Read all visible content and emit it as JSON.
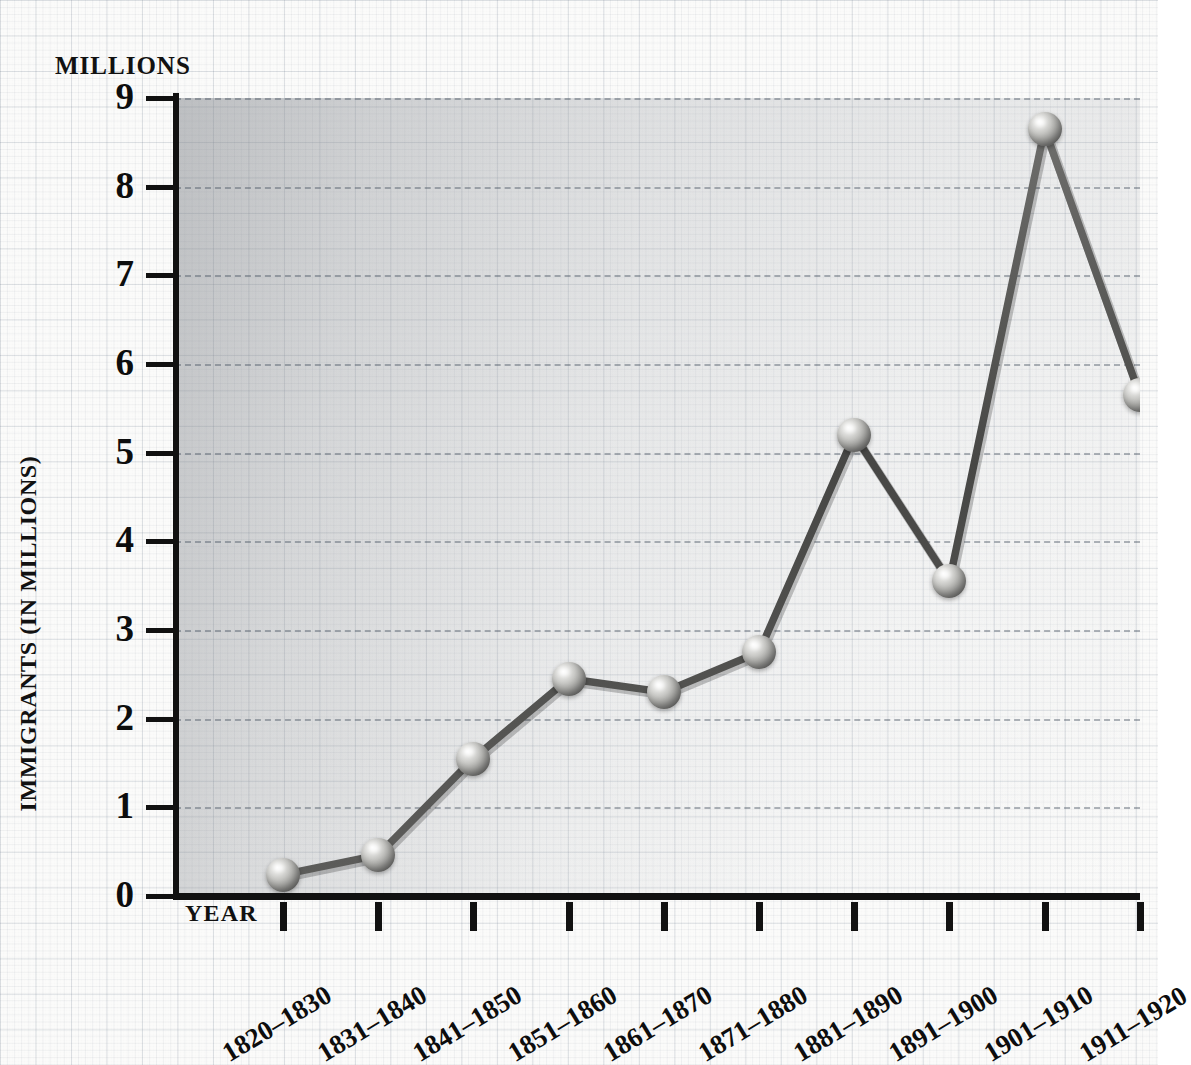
{
  "title": "IMMIGRATION TO THE UNITED STATES, 1820-1920",
  "axes": {
    "y_unit_label": "MILLIONS",
    "y_title": "IMMIGRANTS (IN MILLIONS)",
    "x_title": "YEAR",
    "y_ticks": [
      "9",
      "8",
      "7",
      "6",
      "5",
      "4",
      "3",
      "2",
      "1",
      "0"
    ]
  },
  "chart_data": {
    "type": "line",
    "title": "IMMIGRATION TO THE UNITED STATES, 1820-1920",
    "xlabel": "YEAR",
    "ylabel": "IMMIGRANTS (IN MILLIONS)",
    "ylim": [
      0,
      9
    ],
    "yticks": [
      0,
      1,
      2,
      3,
      4,
      5,
      6,
      7,
      8,
      9
    ],
    "grid": "horizontal-dashed",
    "legend": "none",
    "units": "millions",
    "categories": [
      "1820–1830",
      "1831–1840",
      "1841–1850",
      "1851–1860",
      "1861–1870",
      "1871–1880",
      "1881–1890",
      "1891–1900",
      "1901–1910",
      "1911–1920"
    ],
    "values": [
      0.24,
      0.46,
      1.55,
      2.45,
      2.3,
      2.75,
      5.2,
      3.55,
      8.65,
      5.65
    ]
  },
  "style": {
    "marker": "sphere-3d-metallic",
    "line_color": "#4a4a48",
    "gridline_color": "#46505f",
    "text_color": "#0d0d0d",
    "paper_color": "#fbfbfa"
  }
}
